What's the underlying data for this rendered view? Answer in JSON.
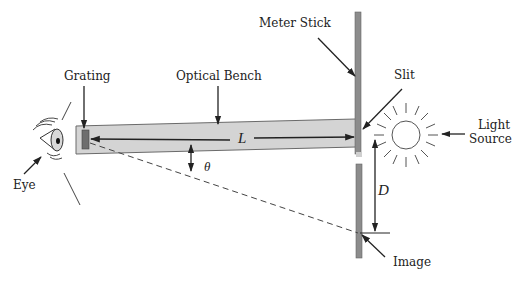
{
  "diagram": {
    "labels": {
      "grating": "Grating",
      "optical_bench": "Optical Bench",
      "meter_stick": "Meter Stick",
      "slit": "Slit",
      "light_source_line1": "Light",
      "light_source_line2": "Source",
      "eye": "Eye",
      "image": "Image"
    },
    "variables": {
      "length": "L",
      "angle": "θ",
      "distance": "D"
    },
    "colors": {
      "bench_fill": "#d4d4d4",
      "bench_stroke": "#6a6a6a",
      "meter_stick_fill": "#8c8c8c",
      "grating_fill": "#6e6e6e",
      "line": "#222222"
    }
  }
}
